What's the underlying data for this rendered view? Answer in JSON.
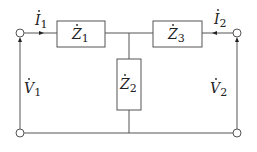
{
  "diagram": {
    "type": "two-port T-network",
    "impedances": [
      {
        "id": "Z1",
        "symbol": "Z",
        "subscript": "1",
        "position": "series-left"
      },
      {
        "id": "Z2",
        "symbol": "Z",
        "subscript": "2",
        "position": "shunt"
      },
      {
        "id": "Z3",
        "symbol": "Z",
        "subscript": "3",
        "position": "series-right"
      }
    ],
    "currents": [
      {
        "id": "I1",
        "symbol": "I",
        "subscript": "1",
        "direction": "into-port-1"
      },
      {
        "id": "I2",
        "symbol": "I",
        "subscript": "2",
        "direction": "into-port-2"
      }
    ],
    "voltages": [
      {
        "id": "V1",
        "symbol": "V",
        "subscript": "1",
        "port": "left"
      },
      {
        "id": "V2",
        "symbol": "V",
        "subscript": "2",
        "port": "right"
      }
    ],
    "colors": {
      "line": "#555555",
      "text": "#222222",
      "background": "#ffffff"
    }
  }
}
